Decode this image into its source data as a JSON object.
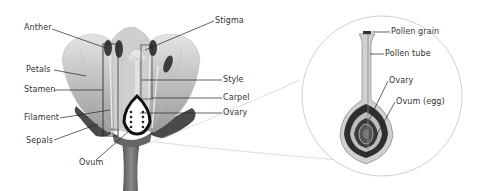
{
  "diagram": {
    "flower_labels": {
      "anther": "Anther",
      "petals": "Petals",
      "stamen": "Stamen",
      "filament": "Filament",
      "sepals": "Sepals",
      "ovum": "Ovum",
      "stigma": "Stigma",
      "style": "Style",
      "carpel": "Carpel",
      "ovary": "Ovary"
    },
    "inset_labels": {
      "pollen_grain": "Pollen grain",
      "pollen_tube": "Pollen tube",
      "ovary": "Ovary",
      "ovum_egg": "Ovum (egg)"
    },
    "colors": {
      "background": "#ffffff",
      "petal_light": "#d6d6d6",
      "petal_mid": "#a9a9a9",
      "dark": "#3a3a3a",
      "leader_line": "#222222",
      "inset_circle": "#c8c8c8"
    }
  }
}
